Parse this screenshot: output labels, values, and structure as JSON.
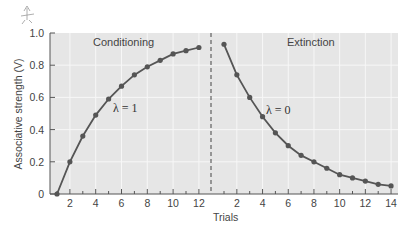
{
  "chart_data": {
    "type": "line",
    "title": "",
    "xlabel": "Trials",
    "ylabel": "Associative strength (V)",
    "ylim": [
      0,
      1.0
    ],
    "yticks": [
      "0",
      "0.2",
      "0.4",
      "0.6",
      "0.8",
      "1.0"
    ],
    "grid": true,
    "legend": null,
    "divider": "dashed vertical line between conditioning and extinction phases",
    "panels": [
      {
        "name": "Conditioning",
        "annotation": "λ = 1",
        "xticks": [
          "2",
          "4",
          "6",
          "8",
          "10",
          "12"
        ],
        "x": [
          1,
          2,
          3,
          4,
          5,
          6,
          7,
          8,
          9,
          10,
          11,
          12
        ],
        "values": [
          0.0,
          0.2,
          0.36,
          0.49,
          0.59,
          0.67,
          0.74,
          0.79,
          0.83,
          0.87,
          0.89,
          0.91
        ]
      },
      {
        "name": "Extinction",
        "annotation": "λ = 0",
        "xticks": [
          "2",
          "4",
          "6",
          "8",
          "10",
          "12",
          "14"
        ],
        "x": [
          1,
          2,
          3,
          4,
          5,
          6,
          7,
          8,
          9,
          10,
          11,
          12,
          13,
          14
        ],
        "values": [
          0.93,
          0.74,
          0.6,
          0.48,
          0.38,
          0.3,
          0.24,
          0.2,
          0.16,
          0.12,
          0.1,
          0.08,
          0.06,
          0.05
        ]
      }
    ]
  },
  "labels": {
    "conditioning": "Conditioning",
    "extinction": "Extinction",
    "lambda_conditioning": "λ = 1",
    "lambda_extinction": "λ = 0",
    "xlabel": "Trials",
    "ylabel": "Associative strength (V)"
  },
  "colors": {
    "plot_bg": "#e6e6e6",
    "grid": "#f7f7f7",
    "line": "#555555",
    "marker": "#555555",
    "axis": "#555555"
  }
}
